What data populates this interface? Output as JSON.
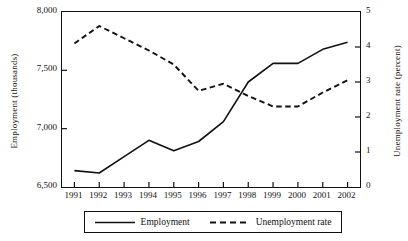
{
  "chart_data": {
    "type": "line",
    "title": "",
    "xlabel": "",
    "ylabel": "Employment (thousands)",
    "y2label": "Unemployment rate (percent)",
    "grid": false,
    "legend_position": "bottom",
    "x": [
      1991,
      1992,
      1993,
      1994,
      1995,
      1996,
      1997,
      1998,
      1999,
      2000,
      2001,
      2002
    ],
    "xtick_labels": [
      "1991",
      "1992",
      "1993",
      "1994",
      "1995",
      "1996",
      "1997",
      "1998",
      "1999",
      "2000",
      "2001",
      "2002"
    ],
    "ylim": [
      6500,
      8000
    ],
    "ytick_labels": [
      "6,500",
      "7,000",
      "7,500",
      "8,000"
    ],
    "ytick_values": [
      6500,
      7000,
      7500,
      8000
    ],
    "y2lim": [
      0,
      5
    ],
    "y2tick_labels": [
      "0",
      "1",
      "2",
      "3",
      "4",
      "5"
    ],
    "y2tick_values": [
      0,
      1,
      2,
      3,
      4,
      5
    ],
    "series": [
      {
        "name": "Employment",
        "axis": "left",
        "style": "solid",
        "color": "#111111",
        "values": [
          6640,
          6620,
          6760,
          6900,
          6810,
          6890,
          7060,
          7400,
          7560,
          7560,
          7680,
          7740
        ]
      },
      {
        "name": "Unemployment rate",
        "axis": "right",
        "style": "dashed",
        "color": "#111111",
        "values": [
          4.1,
          4.6,
          4.25,
          3.9,
          3.5,
          2.75,
          2.95,
          2.6,
          2.3,
          2.3,
          2.7,
          3.05
        ]
      }
    ]
  },
  "legend": {
    "items": [
      {
        "label": "Employment",
        "style": "solid"
      },
      {
        "label": "Unemployment rate",
        "style": "dashed"
      }
    ]
  }
}
